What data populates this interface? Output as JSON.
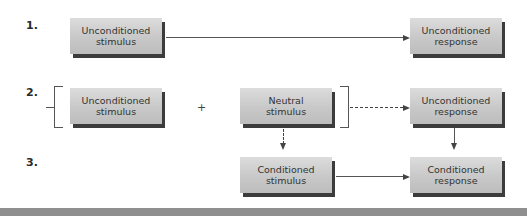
{
  "diagram": {
    "steps": [
      {
        "label": "1."
      },
      {
        "label": "2."
      },
      {
        "label": "3."
      }
    ],
    "boxes": {
      "ucs_1": {
        "line1": "Unconditioned",
        "line2": "stimulus"
      },
      "ucr_1": {
        "line1": "Unconditioned",
        "line2": "response"
      },
      "ucs_2": {
        "line1": "Unconditioned",
        "line2": "stimulus"
      },
      "neutral_2": {
        "line1": "Neutral",
        "line2": "stimulus"
      },
      "ucr_2": {
        "line1": "Unconditioned",
        "line2": "response"
      },
      "cs_3": {
        "line1": "Conditioned",
        "line2": "stimulus"
      },
      "cr_3": {
        "line1": "Conditioned",
        "line2": "response"
      }
    },
    "operator": "+",
    "colors": {
      "box_fill": "#c8c8c8",
      "box_shadow": "#3c3c3c",
      "line": "#555555",
      "bottom_bar": "#8f8f8f"
    }
  }
}
